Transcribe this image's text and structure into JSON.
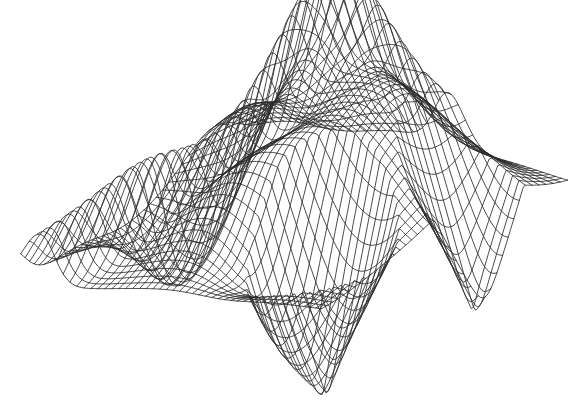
{
  "figure": {
    "kind": "wireframe-surface-plot",
    "title": "",
    "background_color": "#ffffff",
    "line_color": "#2b2b2b",
    "line_width": 0.85,
    "canvas": {
      "width": 568,
      "height": 416
    }
  },
  "chart_data": {
    "type": "line",
    "render": "3d-wireframe-mesh",
    "title": "",
    "subtitle": "",
    "xlabel": "",
    "ylabel": "",
    "zlabel": "",
    "grid": false,
    "legend": "none",
    "annotations": [],
    "tick_labels": {
      "x": [],
      "y": [],
      "z": []
    },
    "axes_visible": false,
    "mesh": {
      "u_steps": 46,
      "v_steps": 40,
      "u_range": [
        -1.0,
        1.0
      ],
      "v_range": [
        -1.0,
        1.0
      ],
      "surface_name": "folded-cusp-surface",
      "comment": "Height field z = f(u,v) composed of gaussian bumps, ridges and two conical singularities; drawn as constant-u and constant-v polylines.",
      "bumps": [
        {
          "amp": 1.0,
          "cu": -0.18,
          "cv": -0.52,
          "su": 0.4,
          "sv": 0.36
        },
        {
          "amp": 0.92,
          "cu": 0.46,
          "cv": -0.3,
          "su": 0.52,
          "sv": 0.48
        },
        {
          "amp": 0.74,
          "cu": 0.1,
          "cv": 0.34,
          "su": 0.62,
          "sv": 0.44
        },
        {
          "amp": -0.55,
          "cu": -0.62,
          "cv": 0.05,
          "su": 0.26,
          "sv": 0.3
        },
        {
          "amp": -0.42,
          "cu": 0.3,
          "cv": 0.62,
          "su": 0.3,
          "sv": 0.26
        },
        {
          "amp": 0.36,
          "cu": -0.8,
          "cv": -0.7,
          "su": 0.3,
          "sv": 0.3
        }
      ],
      "cones": [
        {
          "amp": -1.25,
          "cu": 0.58,
          "cv": 0.46,
          "radius": 0.42
        },
        {
          "amp": -1.05,
          "cu": 0.92,
          "cv": -0.34,
          "radius": 0.36
        }
      ],
      "ridge": {
        "amp": 0.7,
        "axis_u": -0.35,
        "width": 0.14,
        "tilt": 0.55
      }
    },
    "projection": {
      "type": "oblique-perspective",
      "azimuth_deg": -38,
      "elevation_deg": 26,
      "scale_x": 196,
      "scale_y": 168,
      "z_scale": 86,
      "origin_x": 292,
      "origin_y": 236,
      "perspective_d": 5.2
    },
    "feature_points": [
      {
        "name": "right-fan-apex",
        "x": 527,
        "y": 122
      },
      {
        "name": "lower-cusp-apex",
        "x": 378,
        "y": 315
      },
      {
        "name": "left-fold-crease",
        "x": 55,
        "y": 252
      },
      {
        "name": "top-dark-fold",
        "x": 268,
        "y": 82
      }
    ],
    "extent_px": {
      "left": 33,
      "top": 33,
      "right": 540,
      "bottom": 388
    }
  }
}
